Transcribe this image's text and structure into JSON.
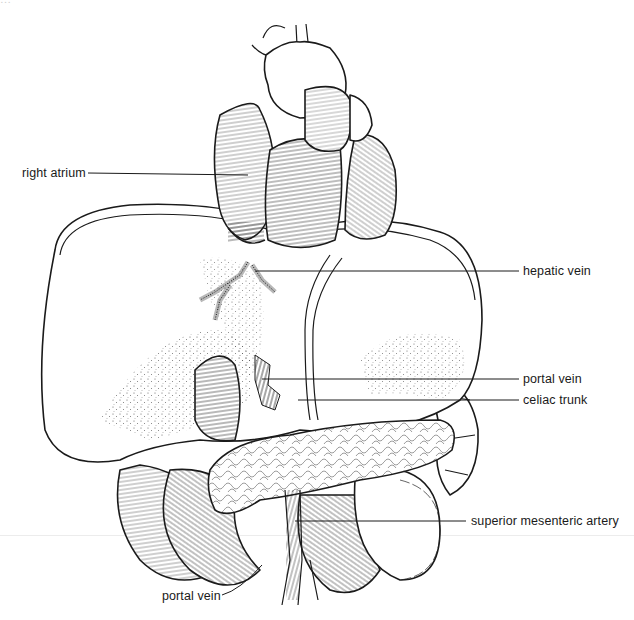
{
  "figure": {
    "type": "anatomical line illustration",
    "header_cutoff_text": "…"
  },
  "labels": [
    {
      "id": "right-atrium",
      "text": "right atrium",
      "side": "left",
      "x": 22,
      "y": 166,
      "line": {
        "x1": 88,
        "y1": 173,
        "x2": 248,
        "y2": 175
      }
    },
    {
      "id": "hepatic-vein",
      "text": "hepatic vein",
      "side": "right",
      "x": 523,
      "y": 264,
      "line": {
        "x1": 255,
        "y1": 271,
        "x2": 519,
        "y2": 271
      }
    },
    {
      "id": "portal-vein-upper",
      "text": "portal vein",
      "side": "right",
      "x": 523,
      "y": 372,
      "line": {
        "x1": 262,
        "y1": 379,
        "x2": 519,
        "y2": 379
      }
    },
    {
      "id": "celiac-trunk",
      "text": "celiac trunk",
      "side": "right",
      "x": 523,
      "y": 393,
      "line": {
        "x1": 298,
        "y1": 400,
        "x2": 519,
        "y2": 400
      }
    },
    {
      "id": "superior-mesenteric-artery",
      "text": "superior mesenteric artery",
      "side": "right",
      "x": 471,
      "y": 514,
      "line": {
        "x1": 295,
        "y1": 521,
        "x2": 466,
        "y2": 521
      }
    },
    {
      "id": "portal-vein-lower",
      "text": "portal vein",
      "side": "left",
      "x": 162,
      "y": 589,
      "line": {
        "x1": 222,
        "y1": 595,
        "x2": 262,
        "y2": 565
      }
    }
  ]
}
